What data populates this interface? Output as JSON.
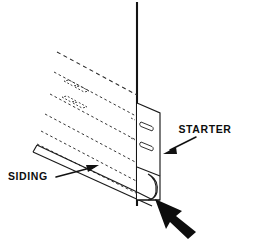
{
  "figure": {
    "background_color": "#ffffff",
    "line_color": "#1a1a1a",
    "labels": [
      {
        "id": "siding",
        "text": "SIDING",
        "x": 8,
        "y": 180,
        "anchor": "start",
        "leader": {
          "from_x": 56,
          "to_x": 96,
          "from_y": 177,
          "to_y": 166
        }
      },
      {
        "id": "starter",
        "text": "STARTER",
        "x": 205,
        "y": 133,
        "anchor": "middle",
        "leader": {
          "from_x": 198,
          "to_x": 163,
          "from_y": 136,
          "to_y": 152
        }
      }
    ],
    "parts": {
      "wall_line": {
        "name": "wall-sheathing-line",
        "x": 137,
        "top_y": 2,
        "bottom_y": 206
      },
      "starter_strip": {
        "name": "starter-strip",
        "face_left_x": 137,
        "face_right_x": 160,
        "top_y": 103,
        "bottom_y": 200,
        "slot_count": 2
      },
      "siding_panel": {
        "name": "siding-panel",
        "hidden": true,
        "top_edge": {
          "x1": 57,
          "y1": 52,
          "x2": 137,
          "y2": 95
        },
        "bottom_edge": {
          "x1": 33,
          "y1": 152,
          "x2": 150,
          "y2": 205
        },
        "nail_slot_rows": 2,
        "dash_rows": 6
      },
      "bottom_arrow": {
        "name": "bottom-pointer-arrow",
        "tip_x": 157,
        "tip_y": 200,
        "tail_x": 196,
        "tail_y": 232
      }
    }
  }
}
